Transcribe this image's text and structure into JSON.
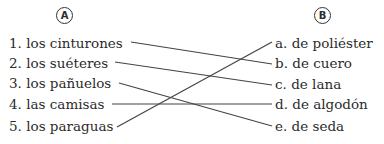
{
  "column_a": {
    "label": "A",
    "items": [
      {
        "number": "1.",
        "text": "los cinturones"
      },
      {
        "number": "2.",
        "text": "los suéteres"
      },
      {
        "number": "3.",
        "text": "los pañuelos"
      },
      {
        "number": "4.",
        "text": "las camisas"
      },
      {
        "number": "5.",
        "text": "los paraguas"
      }
    ]
  },
  "column_b": {
    "label": "B",
    "items": [
      {
        "letter": "a.",
        "text": "de poliéster"
      },
      {
        "letter": "b.",
        "text": "de cuero"
      },
      {
        "letter": "c.",
        "text": "de lana"
      },
      {
        "letter": "d.",
        "text": "de algodón"
      },
      {
        "letter": "e.",
        "text": "de seda"
      }
    ]
  },
  "matches": [
    {
      "from": "1",
      "to": "b"
    },
    {
      "from": "2",
      "to": "c"
    },
    {
      "from": "3",
      "to": "e"
    },
    {
      "from": "4",
      "to": "d"
    },
    {
      "from": "5",
      "to": "a"
    }
  ]
}
